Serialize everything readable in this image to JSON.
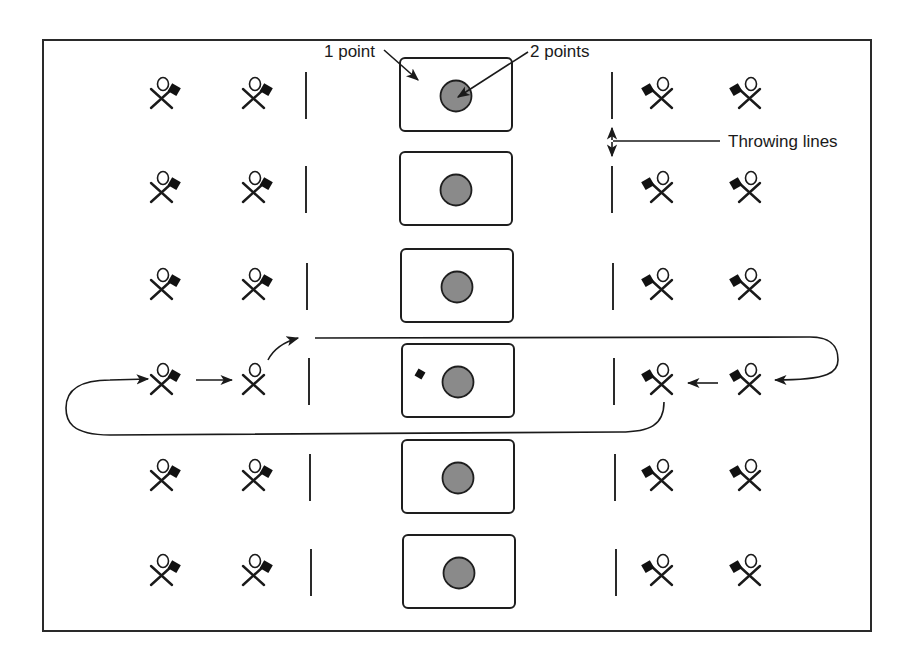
{
  "diagram": {
    "colors": {
      "frame": "#2a2a2a",
      "hole": "#8a8a8a",
      "flag": "#111111"
    },
    "labels": {
      "box_points": "1 point",
      "hole_points": "2 points",
      "throwing_lines": "Throwing lines"
    },
    "rows": [
      {
        "y": 95,
        "box_x": 400,
        "left_line_x": 306,
        "right_line_x": 612
      },
      {
        "y": 189,
        "box_x": 400,
        "left_line_x": 306,
        "right_line_x": 612
      },
      {
        "y": 286,
        "box_x": 401,
        "left_line_x": 307,
        "right_line_x": 613
      },
      {
        "y": 381,
        "box_x": 402,
        "left_line_x": 309,
        "right_line_x": 614
      },
      {
        "y": 477,
        "box_x": 402,
        "left_line_x": 310,
        "right_line_x": 615
      },
      {
        "y": 572,
        "box_x": 403,
        "left_line_x": 311,
        "right_line_x": 616
      }
    ],
    "players_left": [
      {
        "x": 160,
        "flag": true
      },
      {
        "x": 252,
        "flag": true
      }
    ],
    "players_right": [
      {
        "x": 660,
        "flag": true
      },
      {
        "x": 748,
        "flag": true
      }
    ],
    "rotation_row_index": 3,
    "rotation_note": "Player without bag on left, bag in box on rotation row"
  }
}
